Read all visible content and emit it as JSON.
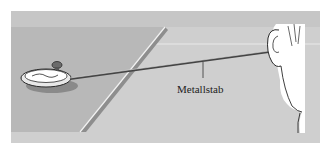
{
  "figure": {
    "label": "Metallstab",
    "colors": {
      "panel_bg": "#cfcfcf",
      "table_top": "#b9b9b9",
      "table_edge": "#8f8f8f",
      "table_highlight": "#f2f2f2",
      "rod": "#555555",
      "face": "#ffffff",
      "outline": "#2a2a2a"
    }
  }
}
